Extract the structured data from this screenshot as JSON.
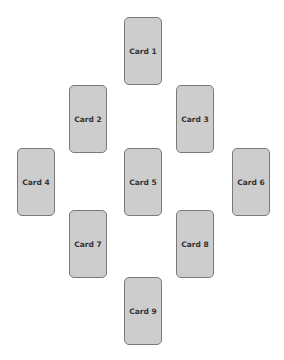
{
  "diagram": {
    "layout": "diamond spread",
    "cards": [
      {
        "label": "Card 1",
        "x": 124,
        "y": 17
      },
      {
        "label": "Card 2",
        "x": 69,
        "y": 85
      },
      {
        "label": "Card 3",
        "x": 176,
        "y": 85
      },
      {
        "label": "Card 4",
        "x": 17,
        "y": 148
      },
      {
        "label": "Card 5",
        "x": 124,
        "y": 148
      },
      {
        "label": "Card 6",
        "x": 232,
        "y": 148
      },
      {
        "label": "Card 7",
        "x": 69,
        "y": 210
      },
      {
        "label": "Card 8",
        "x": 176,
        "y": 210
      },
      {
        "label": "Card 9",
        "x": 124,
        "y": 277
      }
    ]
  }
}
